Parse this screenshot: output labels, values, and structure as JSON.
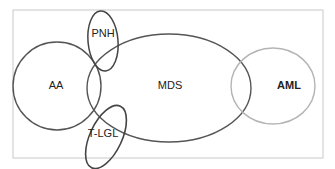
{
  "diagram": {
    "type": "venn",
    "frame": {
      "x": 13,
      "y": 10,
      "width": 310,
      "height": 148,
      "stroke": "#c8c8c8"
    },
    "sets": [
      {
        "id": "aa",
        "label": "AA",
        "bold": false,
        "shape": "circle",
        "cx": 57,
        "cy": 86,
        "rx": 44,
        "ry": 44,
        "rotate": 0,
        "stroke": "#555555",
        "stroke_width": 1.4,
        "label_x": 56,
        "label_y": 85
      },
      {
        "id": "mds",
        "label": "MDS",
        "bold": false,
        "shape": "ellipse",
        "cx": 169,
        "cy": 88,
        "rx": 82,
        "ry": 54,
        "rotate": 0,
        "stroke": "#555555",
        "stroke_width": 1.4,
        "label_x": 170,
        "label_y": 85
      },
      {
        "id": "aml",
        "label": "AML",
        "bold": true,
        "shape": "ellipse",
        "cx": 273,
        "cy": 86,
        "rx": 42,
        "ry": 38,
        "rotate": 0,
        "stroke": "#b4b4b4",
        "stroke_width": 1.4,
        "label_x": 289,
        "label_y": 85
      },
      {
        "id": "pnh",
        "label": "PNH",
        "bold": false,
        "shape": "ellipse",
        "cx": 103,
        "cy": 41,
        "rx": 15,
        "ry": 30,
        "rotate": -5,
        "stroke": "#444444",
        "stroke_width": 1.5,
        "label_x": 103,
        "label_y": 33
      },
      {
        "id": "tlgl",
        "label": "T-LGL",
        "bold": false,
        "shape": "ellipse",
        "cx": 106,
        "cy": 137,
        "rx": 16,
        "ry": 34,
        "rotate": 25,
        "stroke": "#444444",
        "stroke_width": 1.6,
        "label_x": 103,
        "label_y": 133
      }
    ]
  }
}
